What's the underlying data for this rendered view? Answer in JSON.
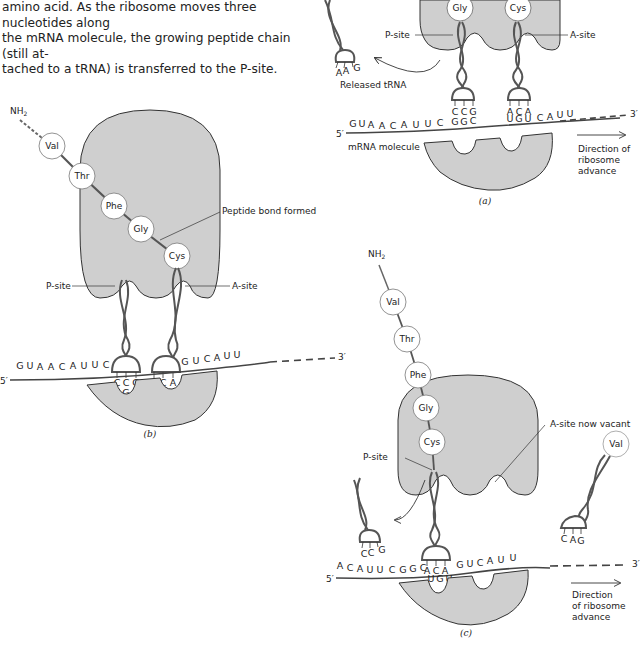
{
  "caption": {
    "lines": [
      "amino acid. As the ribosome moves three nucleotides along",
      "the mRNA molecule, the growing peptide chain (still at-",
      "tached to a tRNA) is transferred to the P-site."
    ]
  },
  "colors": {
    "ribosome_fill": "#cfcfcf",
    "outline": "#333333",
    "text": "#222222",
    "background": "#ffffff"
  },
  "panel_a": {
    "label": "(a)",
    "amino_acids_visible": [
      "Gly",
      "Cys"
    ],
    "p_site_label": "P-site",
    "a_site_label": "A-site",
    "released_trna_label": "Released tRNA",
    "released_anticodon": [
      "A",
      "A",
      "G"
    ],
    "p_anticodon": [
      "C",
      "C",
      "G"
    ],
    "a_anticodon": [
      "A",
      "C",
      "A"
    ],
    "mrna_sequence": [
      "G",
      "U",
      "A",
      "A",
      "C",
      "A",
      "U",
      "U",
      "C",
      "G",
      "G",
      "C",
      "U",
      "G",
      "U",
      "C",
      "A",
      "U",
      "U"
    ],
    "five_prime": "5′",
    "three_prime": "3′",
    "mrna_label": "mRNA molecule",
    "direction_label": [
      "Direction of",
      "ribosome",
      "advance"
    ]
  },
  "panel_b": {
    "label": "(b)",
    "n_terminus": "NH2",
    "peptide_chain": [
      "Val",
      "Thr",
      "Phe",
      "Gly",
      "Cys"
    ],
    "peptide_bond_label": "Peptide bond formed",
    "p_site_label": "P-site",
    "a_site_label": "A-site",
    "p_anticodon": [
      "C",
      "C",
      "G"
    ],
    "a_anticodon": [
      "A",
      "C",
      "A"
    ],
    "mrna_sequence": [
      "G",
      "U",
      "A",
      "A",
      "C",
      "A",
      "U",
      "U",
      "C",
      "G",
      "G",
      "C",
      "U",
      "G",
      "U",
      "G",
      "U",
      "C",
      "A",
      "U",
      "U"
    ],
    "five_prime": "5′",
    "three_prime": "3′"
  },
  "panel_c": {
    "label": "(c)",
    "n_terminus": "NH2",
    "peptide_chain": [
      "Val",
      "Thr",
      "Phe",
      "Gly",
      "Cys"
    ],
    "a_site_vacant_label": "A-site now vacant",
    "p_site_label": "P-site",
    "incoming_amino_acid": "Val",
    "incoming_anticodon": [
      "C",
      "A",
      "G"
    ],
    "released_anticodon": [
      "C",
      "C",
      "G"
    ],
    "p_anticodon": [
      "A",
      "C",
      "A"
    ],
    "mrna_sequence": [
      "A",
      "C",
      "A",
      "U",
      "U",
      "C",
      "G",
      "G",
      "C",
      "U",
      "G",
      "U",
      "G",
      "U",
      "C",
      "A",
      "U",
      "U"
    ],
    "five_prime": "5′",
    "three_prime": "3′",
    "direction_label": [
      "Direction",
      "of ribosome",
      "advance"
    ]
  }
}
